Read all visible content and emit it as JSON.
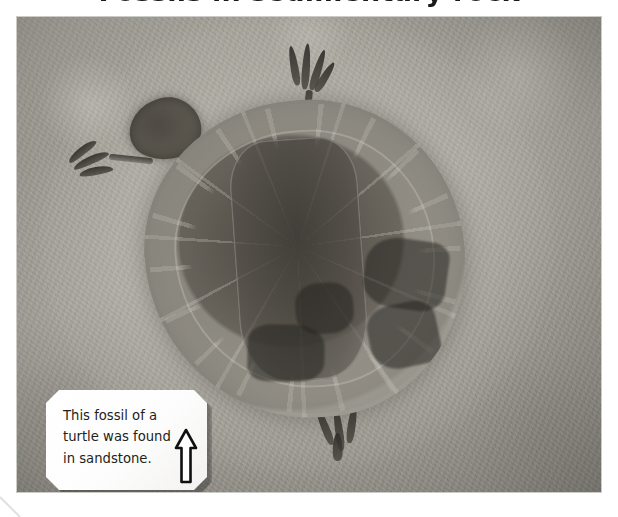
{
  "page": {
    "background_color": "#ffffff",
    "heading_clipped": "Fossils in sedimentary rock",
    "heading_note": "top heading is cropped off by the screenshot edge"
  },
  "figure": {
    "name": "turtle-fossil-photograph",
    "alt": "Photograph of a fossilised turtle preserved in a slab of pale sandstone; the domed carapace shows individual scute plates, with the skull at the upper left and four clawed limbs projecting from the shell.",
    "frame": {
      "x": 17,
      "y": 17,
      "width": 584,
      "height": 475
    },
    "colors": {
      "rock_light": "#d8d6ce",
      "rock_mid": "#a3a199",
      "rock_dark": "#8e8c84",
      "fossil_dark": "#4e4a44",
      "fossil_mid": "#6b675f",
      "seam_light": "#d6d3cd"
    },
    "subject_parts": [
      "skull",
      "carapace",
      "marginal-scutes",
      "vertebral-scutes",
      "front-left-claw",
      "front-right-claw",
      "hind-left-claw",
      "hind-right-claw"
    ]
  },
  "callout": {
    "text": "This fossil of a\nturtle was found\nin sandstone.",
    "lines": [
      "This fossil of a",
      "turtle was found",
      "in sandstone."
    ],
    "icon": "arrow-up-icon",
    "text_color": "#231f20",
    "background_color": "#ffffff"
  }
}
